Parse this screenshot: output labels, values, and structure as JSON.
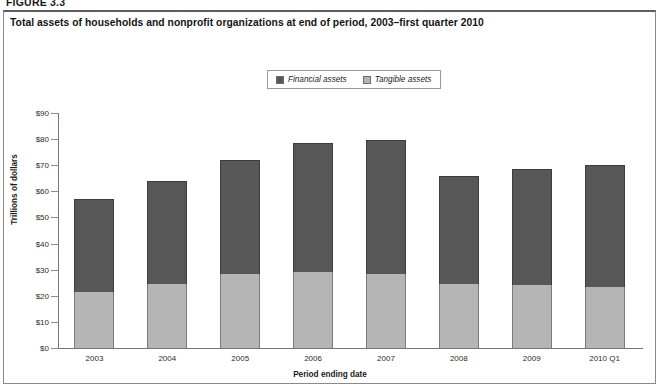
{
  "figure_label": "FIGURE 3.3",
  "chart_title": "Total assets of households and nonprofit organizations at end of period, 2003–first quarter 2010",
  "legend": {
    "entries": [
      {
        "label": "Financial assets",
        "color": "#575757"
      },
      {
        "label": "Tangible assets",
        "color": "#b5b5b5"
      }
    ]
  },
  "axis": {
    "y_title": "Trillions of dollars",
    "x_title": "Period ending date",
    "y_ticks": [
      "$90",
      "$80",
      "$70",
      "$60",
      "$50",
      "$40",
      "$30",
      "$20",
      "$10",
      "$0"
    ]
  },
  "chart_data": {
    "type": "bar",
    "stacked": true,
    "title": "Total assets of households and nonprofit organizations at end of period, 2003–first quarter 2010",
    "xlabel": "Period ending date",
    "ylabel": "Trillions of dollars",
    "ylim": [
      0,
      90
    ],
    "ytick_step": 10,
    "ytick_prefix": "$",
    "grid": false,
    "legend_position": "top-center",
    "categories": [
      "2003",
      "2004",
      "2005",
      "2006",
      "2007",
      "2008",
      "2009",
      "2010 Q1"
    ],
    "series": [
      {
        "name": "Tangible assets",
        "color": "#b5b5b5",
        "values": [
          21.5,
          24.5,
          28.5,
          29.0,
          28.5,
          24.5,
          24.0,
          23.5
        ]
      },
      {
        "name": "Financial assets",
        "color": "#575757",
        "values": [
          35.5,
          39.5,
          43.5,
          49.5,
          51.0,
          41.5,
          44.5,
          46.5
        ]
      }
    ],
    "totals": [
      57.0,
      64.0,
      72.0,
      78.5,
      79.5,
      66.0,
      68.5,
      70.0
    ]
  }
}
